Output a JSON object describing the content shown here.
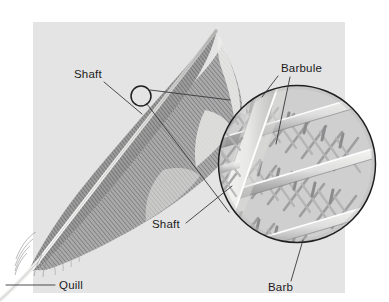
{
  "figure": {
    "background_color": "#ffffff",
    "panel_color": "#e4e4e4",
    "ink_color": "#39393c",
    "feather_dark": "#6f6f70",
    "feather_mid": "#8f8f90",
    "feather_light": "#d6d6d6",
    "shaft_color": "#f2f2f0"
  },
  "panel": {
    "x": 33,
    "y": 22,
    "width": 312,
    "height": 271
  },
  "labels": [
    {
      "id": "shaft-upper",
      "text": "Shaft",
      "x": 74,
      "y": 78,
      "anchor": "start",
      "leader": [
        [
          104,
          82
        ],
        [
          142,
          114
        ]
      ]
    },
    {
      "id": "barbule",
      "text": "Barbule",
      "x": 281,
      "y": 72,
      "anchor": "start",
      "leader": [
        [
          278,
          76
        ],
        [
          262,
          96
        ]
      ]
    },
    {
      "id": "barbule-second",
      "text": "",
      "x": 0,
      "y": 0,
      "anchor": "start",
      "leader": [
        [
          290,
          77
        ],
        [
          276,
          143
        ]
      ]
    },
    {
      "id": "shaft-lower",
      "text": "Shaft",
      "x": 152,
      "y": 228,
      "anchor": "start",
      "leader": [
        [
          186,
          223
        ],
        [
          231,
          186
        ]
      ]
    },
    {
      "id": "barb",
      "text": "Barb",
      "x": 268,
      "y": 290,
      "anchor": "start",
      "leader": [
        [
          290,
          280
        ],
        [
          302,
          239
        ]
      ]
    },
    {
      "id": "quill",
      "text": "Quill",
      "x": 59,
      "y": 289,
      "anchor": "start",
      "leader": [
        [
          55,
          285
        ],
        [
          8,
          285
        ]
      ]
    }
  ],
  "callout": {
    "small_circle": {
      "cx": 141,
      "cy": 96,
      "r": 10
    },
    "magnifier_circle": {
      "cx": 297,
      "cy": 164,
      "r": 79
    },
    "connector_top": [
      [
        150,
        90
      ],
      [
        229,
        101
      ]
    ],
    "connector_bottom": [
      [
        147,
        104
      ],
      [
        228,
        211
      ]
    ]
  },
  "magnified_view": {
    "description": "Cross-hatched barbs with interlocking barbules",
    "barb_count": 4,
    "barbule_rows": 4
  }
}
